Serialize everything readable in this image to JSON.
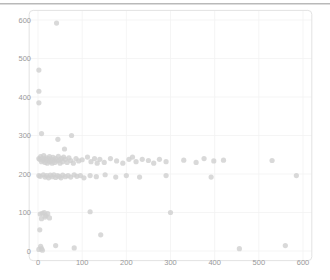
{
  "figure": {
    "background_color": "#ffffff",
    "top_rule_color": "#b9b9b9"
  },
  "chart_data": {
    "type": "scatter",
    "title": "",
    "xlabel": "",
    "ylabel": "",
    "xlim": [
      -20,
      620
    ],
    "ylim": [
      -25,
      625
    ],
    "xticks": [
      0,
      100,
      200,
      300,
      400,
      500,
      600
    ],
    "yticks": [
      0,
      100,
      200,
      300,
      400,
      500,
      600
    ],
    "xtick_labels": [
      "0",
      "100",
      "200",
      "300",
      "400",
      "500",
      "600"
    ],
    "ytick_labels": [
      "0",
      "100",
      "200",
      "300",
      "400",
      "500",
      "600"
    ],
    "grid": true,
    "grid_color": "#f2f2f2",
    "legend": null,
    "marker_color": "#cfcfcf",
    "marker_size": 4,
    "marker_alpha": 0.8,
    "series": [
      {
        "name": "points",
        "points": [
          [
            42,
            592
          ],
          [
            2,
            470
          ],
          [
            2,
            415
          ],
          [
            2,
            385
          ],
          [
            8,
            305
          ],
          [
            45,
            290
          ],
          [
            76,
            300
          ],
          [
            60,
            265
          ],
          [
            2,
            240
          ],
          [
            4,
            238
          ],
          [
            6,
            245
          ],
          [
            8,
            232
          ],
          [
            10,
            240
          ],
          [
            12,
            235
          ],
          [
            13,
            248
          ],
          [
            15,
            238
          ],
          [
            16,
            230
          ],
          [
            18,
            242
          ],
          [
            20,
            236
          ],
          [
            21,
            228
          ],
          [
            23,
            240
          ],
          [
            25,
            234
          ],
          [
            26,
            245
          ],
          [
            28,
            232
          ],
          [
            30,
            238
          ],
          [
            32,
            228
          ],
          [
            34,
            243
          ],
          [
            36,
            236
          ],
          [
            38,
            230
          ],
          [
            40,
            240
          ],
          [
            44,
            234
          ],
          [
            46,
            246
          ],
          [
            48,
            236
          ],
          [
            50,
            228
          ],
          [
            53,
            240
          ],
          [
            56,
            232
          ],
          [
            58,
            244
          ],
          [
            62,
            238
          ],
          [
            66,
            230
          ],
          [
            70,
            242
          ],
          [
            74,
            235
          ],
          [
            80,
            228
          ],
          [
            86,
            240
          ],
          [
            92,
            234
          ],
          [
            100,
            237
          ],
          [
            112,
            244
          ],
          [
            120,
            232
          ],
          [
            128,
            240
          ],
          [
            134,
            228
          ],
          [
            140,
            238
          ],
          [
            150,
            230
          ],
          [
            164,
            240
          ],
          [
            178,
            234
          ],
          [
            192,
            228
          ],
          [
            206,
            238
          ],
          [
            214,
            244
          ],
          [
            222,
            232
          ],
          [
            236,
            238
          ],
          [
            250,
            235
          ],
          [
            262,
            228
          ],
          [
            275,
            238
          ],
          [
            290,
            232
          ],
          [
            330,
            236
          ],
          [
            358,
            230
          ],
          [
            376,
            240
          ],
          [
            398,
            234
          ],
          [
            420,
            236
          ],
          [
            530,
            235
          ],
          [
            2,
            196
          ],
          [
            5,
            194
          ],
          [
            12,
            198
          ],
          [
            16,
            192
          ],
          [
            20,
            196
          ],
          [
            24,
            190
          ],
          [
            28,
            197
          ],
          [
            32,
            193
          ],
          [
            36,
            198
          ],
          [
            40,
            191
          ],
          [
            44,
            196
          ],
          [
            48,
            194
          ],
          [
            52,
            190
          ],
          [
            56,
            197
          ],
          [
            62,
            193
          ],
          [
            68,
            196
          ],
          [
            74,
            192
          ],
          [
            82,
            198
          ],
          [
            88,
            194
          ],
          [
            96,
            196
          ],
          [
            104,
            190
          ],
          [
            118,
            196
          ],
          [
            132,
            193
          ],
          [
            152,
            198
          ],
          [
            176,
            192
          ],
          [
            200,
            196
          ],
          [
            230,
            192
          ],
          [
            290,
            196
          ],
          [
            392,
            192
          ],
          [
            585,
            196
          ],
          [
            5,
            96
          ],
          [
            10,
            98
          ],
          [
            14,
            100
          ],
          [
            18,
            92
          ],
          [
            22,
            97
          ],
          [
            26,
            86
          ],
          [
            8,
            84
          ],
          [
            16,
            88
          ],
          [
            118,
            102
          ],
          [
            300,
            100
          ],
          [
            4,
            55
          ],
          [
            142,
            42
          ],
          [
            6,
            12
          ],
          [
            8,
            6
          ],
          [
            2,
            4
          ],
          [
            10,
            2
          ],
          [
            40,
            14
          ],
          [
            82,
            8
          ],
          [
            456,
            6
          ],
          [
            560,
            14
          ]
        ]
      }
    ]
  }
}
